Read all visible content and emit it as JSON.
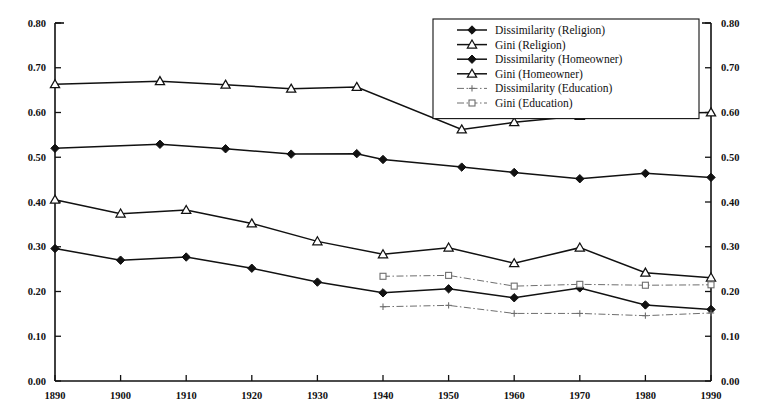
{
  "chart_data": {
    "type": "line",
    "title": "",
    "xlabel": "",
    "ylabel": "",
    "xlim": [
      1890,
      1990
    ],
    "ylim": [
      0.0,
      0.8
    ],
    "grid": false,
    "legend_position": "top-right",
    "y_ticks": [
      "0.00",
      "0.10",
      "0.20",
      "0.30",
      "0.40",
      "0.50",
      "0.60",
      "0.70",
      "0.80"
    ],
    "y_tick_values": [
      0.0,
      0.1,
      0.2,
      0.3,
      0.4,
      0.5,
      0.6,
      0.7,
      0.8
    ],
    "x_ticks": [
      "1890",
      "1900",
      "1910",
      "1920",
      "1930",
      "1940",
      "1950",
      "1960",
      "1970",
      "1980",
      "1990"
    ],
    "x_tick_values": [
      1890,
      1900,
      1910,
      1920,
      1930,
      1940,
      1950,
      1960,
      1970,
      1980,
      1990
    ],
    "axis_right_ticks": [
      "0.00",
      "0.10",
      "0.20",
      "0.30",
      "0.40",
      "0.50",
      "0.60",
      "0.70",
      "0.80"
    ],
    "series": [
      {
        "name": "Dissimilarity (Religion)",
        "marker": "filled-diamond",
        "line": "solid",
        "color": "#111111",
        "x": [
          1890,
          1906,
          1916,
          1926,
          1936,
          1940,
          1952,
          1960,
          1970,
          1980,
          1990
        ],
        "values": [
          0.52,
          0.529,
          0.519,
          0.507,
          0.508,
          0.495,
          0.478,
          0.466,
          0.452,
          0.464,
          0.455
        ]
      },
      {
        "name": "Gini (Religion)",
        "marker": "open-triangle",
        "line": "solid",
        "color": "#111111",
        "x": [
          1890,
          1906,
          1916,
          1926,
          1936,
          1952,
          1960,
          1970,
          1980,
          1990
        ],
        "values": [
          0.663,
          0.67,
          0.662,
          0.653,
          0.657,
          0.562,
          0.578,
          0.592,
          0.598,
          0.6
        ]
      },
      {
        "name": "Dissimilarity (Homeowner)",
        "marker": "filled-diamond",
        "line": "solid",
        "color": "#111111",
        "x": [
          1890,
          1900,
          1910,
          1920,
          1930,
          1940,
          1950,
          1960,
          1970,
          1980,
          1990
        ],
        "values": [
          0.296,
          0.27,
          0.277,
          0.252,
          0.221,
          0.197,
          0.206,
          0.186,
          0.208,
          0.17,
          0.16
        ]
      },
      {
        "name": "Gini (Homeowner)",
        "marker": "open-triangle",
        "line": "solid",
        "color": "#111111",
        "x": [
          1890,
          1900,
          1910,
          1920,
          1930,
          1940,
          1950,
          1960,
          1970,
          1980,
          1990
        ],
        "values": [
          0.405,
          0.374,
          0.382,
          0.352,
          0.312,
          0.283,
          0.298,
          0.263,
          0.298,
          0.242,
          0.231
        ]
      },
      {
        "name": "Dissimilarity (Education)",
        "marker": "small-plus",
        "line": "dash-dot",
        "color": "#6e6e6e",
        "x": [
          1940,
          1950,
          1960,
          1970,
          1980,
          1990
        ],
        "values": [
          0.166,
          0.169,
          0.151,
          0.151,
          0.146,
          0.152
        ]
      },
      {
        "name": "Gini (Education)",
        "marker": "small-open-square",
        "line": "dash-dot",
        "color": "#6e6e6e",
        "x": [
          1940,
          1950,
          1960,
          1970,
          1980,
          1990
        ],
        "values": [
          0.234,
          0.236,
          0.212,
          0.216,
          0.214,
          0.215
        ]
      }
    ]
  },
  "legend": {
    "items": [
      {
        "label": "Dissimilarity (Religion)"
      },
      {
        "label": "Gini (Religion)"
      },
      {
        "label": "Dissimilarity (Homeowner)"
      },
      {
        "label": "Gini (Homeowner)"
      },
      {
        "label": "Dissimilarity (Education)"
      },
      {
        "label": "Gini (Education)"
      }
    ]
  }
}
